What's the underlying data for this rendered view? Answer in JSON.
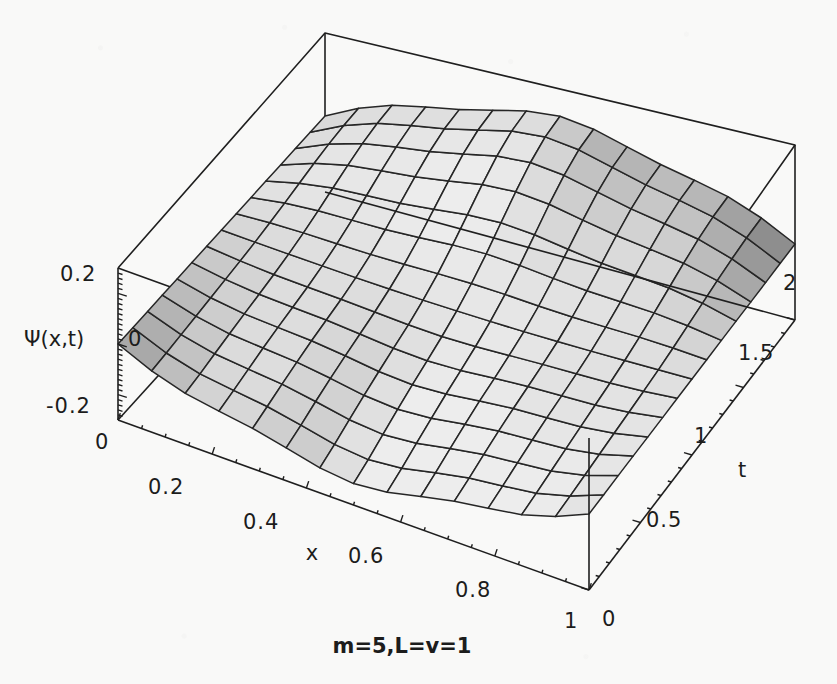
{
  "figure": {
    "kind": "3d-surface-plot",
    "caption": "m=5,L=v=1",
    "background_color": "#f9f9f8",
    "line_color": "#1f1f1f"
  },
  "axes": {
    "x": {
      "label": "x",
      "ticks": [
        "0",
        "0.2",
        "0.4",
        "0.6",
        "0.8",
        "1"
      ],
      "tick_values": [
        0,
        0.2,
        0.4,
        0.6,
        0.8,
        1
      ],
      "range": [
        0,
        1
      ]
    },
    "t": {
      "label": "t",
      "ticks": [
        "0",
        "0.5",
        "1",
        "1.5",
        "2"
      ],
      "tick_values": [
        0,
        0.5,
        1,
        1.5,
        2
      ],
      "range": [
        0,
        2
      ]
    },
    "z": {
      "label": "Ψ(x,t)",
      "ticks": [
        "0.2",
        "0",
        "-0.2"
      ],
      "tick_values": [
        0.2,
        0,
        -0.2
      ],
      "range": [
        -0.3,
        0.3
      ]
    }
  },
  "chart_data": {
    "type": "surface",
    "title": "",
    "subtitle": "",
    "xlabel": "x",
    "ylabel": "t",
    "zlabel": "Ψ(x,t)",
    "annotations": [
      "m=5,L=v=1"
    ],
    "xlim": [
      0,
      1
    ],
    "ylim": [
      0,
      2
    ],
    "zlim": [
      -0.3,
      0.3
    ],
    "grid": true,
    "legend": "none",
    "mesh_divisions": {
      "x": 14,
      "t": 14
    },
    "surface_shading": "grayscale-lighting",
    "formula_note": "standing wave, m=5 mode on L=1 string, v=1",
    "parameters": {
      "m": 5,
      "L": 1,
      "v": 1
    },
    "x": [
      0,
      0.0714,
      0.1429,
      0.2143,
      0.2857,
      0.3571,
      0.4286,
      0.5,
      0.5714,
      0.6429,
      0.7143,
      0.7857,
      0.8571,
      0.9286,
      1
    ],
    "t": [
      0,
      0.1429,
      0.2857,
      0.4286,
      0.5714,
      0.7143,
      0.8571,
      1,
      1.1429,
      1.2857,
      1.4286,
      1.5714,
      1.7143,
      1.8571,
      2
    ],
    "z_sample_rows": [
      {
        "t": 0,
        "values": [
          0.0,
          -0.033,
          -0.064,
          -0.091,
          -0.112,
          -0.127,
          -0.135,
          -0.136,
          -0.13,
          -0.118,
          -0.1,
          -0.078,
          -0.053,
          -0.027,
          0.0
        ]
      },
      {
        "t": 0.5,
        "values": [
          0.0,
          0.018,
          0.036,
          0.051,
          0.063,
          0.071,
          0.076,
          0.076,
          0.073,
          0.066,
          0.056,
          0.044,
          0.03,
          0.015,
          0.0
        ]
      },
      {
        "t": 1,
        "values": [
          0.0,
          0.048,
          0.093,
          0.132,
          0.162,
          0.183,
          0.195,
          0.197,
          0.188,
          0.171,
          0.145,
          0.113,
          0.077,
          0.039,
          0.0
        ]
      },
      {
        "t": 1.5,
        "values": [
          0.0,
          0.046,
          0.089,
          0.126,
          0.155,
          0.176,
          0.187,
          0.188,
          0.18,
          0.163,
          0.139,
          0.108,
          0.074,
          0.037,
          0.0
        ]
      },
      {
        "t": 2,
        "values": [
          0.0,
          0.03,
          0.058,
          0.082,
          0.101,
          0.114,
          0.121,
          0.122,
          0.117,
          0.106,
          0.09,
          0.07,
          0.048,
          0.024,
          0.0
        ]
      }
    ]
  }
}
